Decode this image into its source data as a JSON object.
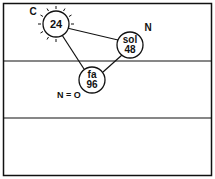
{
  "diagram": {
    "nodes": [
      {
        "id": "c-node",
        "line1": "24",
        "line2": "",
        "corner_label": "C",
        "radiating": true
      },
      {
        "id": "sol-node",
        "line1": "sol",
        "line2": "48",
        "corner_label": "N",
        "radiating": false
      },
      {
        "id": "fa-node",
        "line1": "fa",
        "line2": "96",
        "corner_label": "N = O",
        "radiating": false
      }
    ],
    "edges": [
      {
        "from": "24",
        "to": "sol 48"
      },
      {
        "from": "24",
        "to": "fa 96"
      },
      {
        "from": "sol 48",
        "to": "fa 96"
      }
    ],
    "bands": 3,
    "colors": {
      "ink": "#111111",
      "background": "#ffffff"
    }
  }
}
